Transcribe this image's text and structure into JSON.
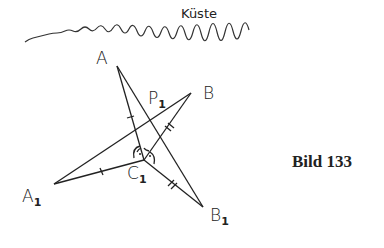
{
  "figure": {
    "coast_label": "Küste",
    "caption": "Bild 133",
    "points": {
      "A": {
        "label": "A",
        "x": 117,
        "y": 66
      },
      "B": {
        "label": "B",
        "x": 191,
        "y": 93
      },
      "C1": {
        "label": "C",
        "sub": "1",
        "x": 144,
        "y": 160
      },
      "A1": {
        "label": "A",
        "sub": "1",
        "x": 54,
        "y": 184
      },
      "B1": {
        "label": "B",
        "sub": "1",
        "x": 203,
        "y": 207
      },
      "P1": {
        "label": "P",
        "sub": "1"
      }
    },
    "segments": [
      {
        "from": "A",
        "to": "C1",
        "tick": "single"
      },
      {
        "from": "A1",
        "to": "C1",
        "tick": "single"
      },
      {
        "from": "B",
        "to": "C1",
        "tick": "double"
      },
      {
        "from": "C1",
        "to": "B1",
        "tick": "double"
      },
      {
        "from": "A",
        "to": "B1"
      },
      {
        "from": "A1",
        "to": "B"
      }
    ],
    "right_angles_at": "C1"
  }
}
